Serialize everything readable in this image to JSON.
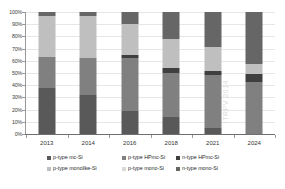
{
  "chart_data": {
    "type": "bar",
    "subtype": "stacked-percentage-column",
    "title": "",
    "xlabel": "",
    "ylabel": "",
    "ylim": [
      0,
      100
    ],
    "yunit": "%",
    "grid": true,
    "legend_position": "bottom",
    "categories": [
      "2013",
      "2014",
      "2016",
      "2018",
      "2021",
      "2024"
    ],
    "y_ticks": [
      "0%",
      "10%",
      "20%",
      "30%",
      "40%",
      "50%",
      "60%",
      "70%",
      "80%",
      "90%",
      "100%"
    ],
    "y_tick_values": [
      0,
      10,
      20,
      30,
      40,
      50,
      60,
      70,
      80,
      90,
      100
    ],
    "watermark": "ITRPV 2014",
    "series": [
      {
        "name": "p-type mc-Si",
        "color": "#595959",
        "values": [
          38,
          32,
          19,
          14,
          5,
          0
        ]
      },
      {
        "name": "p-type HPmc-Si",
        "color": "#808080",
        "values": [
          25,
          30,
          43,
          36,
          43,
          43
        ]
      },
      {
        "name": "n-type HPmc-Si",
        "color": "#3f3f3f",
        "values": [
          0,
          0,
          3,
          4,
          4,
          6
        ]
      },
      {
        "name": "p-type monolike-Si",
        "color": "#bfbfbf",
        "values": [
          34,
          35,
          25,
          24,
          19,
          8
        ]
      },
      {
        "name": "p-type mono-Si",
        "color": "#d9d9d9",
        "values": [
          0,
          0,
          0,
          0,
          0,
          0
        ]
      },
      {
        "name": "n-type mono-Si",
        "color": "#666666",
        "values": [
          3,
          3,
          10,
          22,
          29,
          43
        ]
      }
    ],
    "legend_entries": [
      "p-type mc-Si",
      "p-type HPmc-Si",
      "n-type HPmc-Si",
      "p-type monolike-Si",
      "p-type mono-Si",
      "n-type mono-Si"
    ],
    "legend_colors": [
      "#595959",
      "#808080",
      "#3f3f3f",
      "#bfbfbf",
      "#d9d9d9",
      "#666666"
    ]
  }
}
